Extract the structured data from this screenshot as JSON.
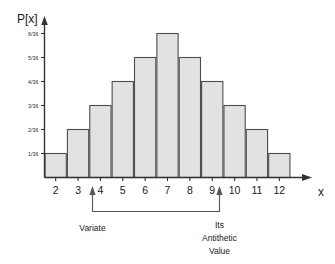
{
  "chart_data": {
    "type": "bar",
    "title": "",
    "subtitle": "",
    "xlabel": "x",
    "ylabel": "P[x]",
    "categories": [
      "2",
      "3",
      "4",
      "5",
      "6",
      "7",
      "8",
      "9",
      "10",
      "11",
      "12"
    ],
    "values": [
      1,
      2,
      3,
      4,
      5,
      6,
      5,
      4,
      3,
      2,
      1
    ],
    "value_labels": [
      "1/36",
      "2/36",
      "3/36",
      "4/36",
      "5/36",
      "6/36",
      "5/36",
      "4/36",
      "3/36",
      "2/36",
      "1/36"
    ],
    "ytick_labels": [
      "1/36",
      "2/36",
      "3/36",
      "4/36",
      "5/36",
      "6/36"
    ],
    "ytick_values": [
      1,
      2,
      3,
      4,
      5,
      6
    ],
    "ylim": [
      0,
      6.8
    ],
    "xlim": [
      1.5,
      12.5
    ],
    "grid": false,
    "legend": null,
    "bar_fill_color": "#e2e2e2",
    "bar_border_color": "#4d4d4d",
    "axis_color": "#333333",
    "annotations": [
      {
        "name": "variate",
        "text": "Variate",
        "lines": [
          "Variate"
        ],
        "points_at_category": "4"
      },
      {
        "name": "antithetic-value",
        "text": "Its Antithetic Value",
        "lines": [
          "Its",
          "Antithetic",
          "Value"
        ],
        "points_at_category": "10"
      }
    ]
  },
  "axes": {
    "y_axis_label": "P[x]",
    "x_axis_label": "x"
  },
  "yticks": [
    {
      "label": "6/36"
    },
    {
      "label": "5/36"
    },
    {
      "label": "4/36"
    },
    {
      "label": "3/36"
    },
    {
      "label": "2/36"
    },
    {
      "label": "1/36"
    }
  ],
  "xticks": [
    {
      "label": "2"
    },
    {
      "label": "3"
    },
    {
      "label": "4"
    },
    {
      "label": "5"
    },
    {
      "label": "6"
    },
    {
      "label": "7"
    },
    {
      "label": "8"
    },
    {
      "label": "9"
    },
    {
      "label": "10"
    },
    {
      "label": "11"
    },
    {
      "label": "12"
    }
  ],
  "annotation_left": {
    "line1": "Variate"
  },
  "annotation_right": {
    "line1": "Its",
    "line2": "Antithetic",
    "line3": "Value"
  }
}
